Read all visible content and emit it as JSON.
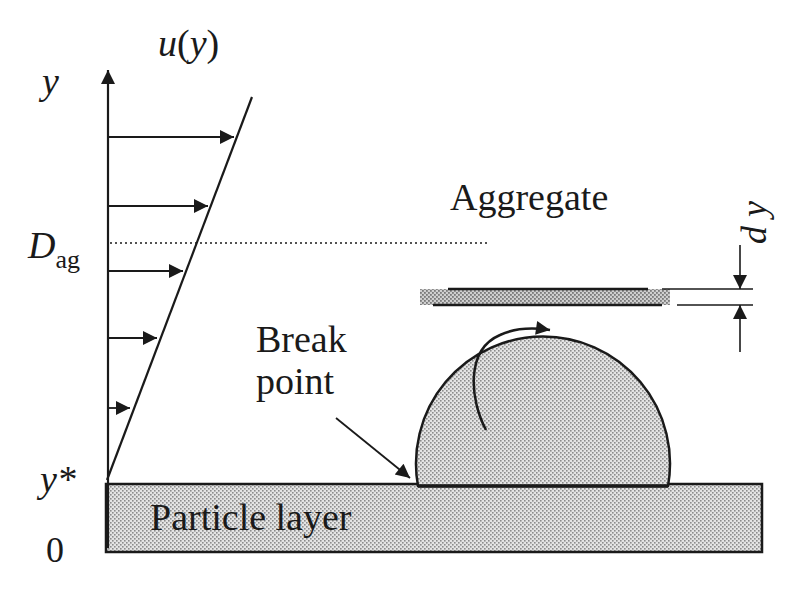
{
  "diagram": {
    "labels": {
      "velocity_profile": "u(y)",
      "velocity_u": "u",
      "velocity_paren_open": "(",
      "velocity_y": "y",
      "velocity_paren_close": ")",
      "y_axis": "y",
      "d_ag_main": "D",
      "d_ag_sub": "ag",
      "y_star": "y*",
      "zero": "0",
      "aggregate": "Aggregate",
      "dy": "d y",
      "break_line1": "Break",
      "break_line2": "point",
      "particle_layer": "Particle layer"
    },
    "colors": {
      "stroke": "#1a1a1a",
      "fill_dots": "#9a9a9a",
      "fill_base": "#e6e6e6",
      "band_fill": "#c8c8c8"
    },
    "velocity_arrows": [
      {
        "y": 137,
        "x_end": 234
      },
      {
        "y": 206,
        "x_end": 208
      },
      {
        "y": 271,
        "x_end": 183
      },
      {
        "y": 338,
        "x_end": 157
      },
      {
        "y": 408,
        "x_end": 130
      }
    ]
  }
}
